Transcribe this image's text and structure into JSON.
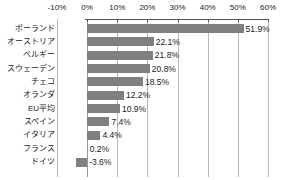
{
  "chart_data": {
    "type": "bar",
    "orientation": "horizontal",
    "title": "",
    "xlabel": "",
    "ylabel": "",
    "xlim": [
      -10,
      60
    ],
    "ylim": null,
    "grid": true,
    "legend": null,
    "axis_tick_labels": [
      "-10%",
      "0%",
      "10%",
      "20%",
      "30%",
      "40%",
      "50%",
      "60%"
    ],
    "axis_tick_values": [
      -10,
      0,
      10,
      20,
      30,
      40,
      50,
      60
    ],
    "bar_color": "#808080",
    "gridline_color": "#b9b9b9",
    "categories": [
      "ポーランド",
      "オーストリア",
      "ベルギー",
      "スウェーデン",
      "チェコ",
      "オランダ",
      "EU平均",
      "スペイン",
      "イタリア",
      "フランス",
      "ドイツ"
    ],
    "values": [
      51.9,
      22.1,
      21.8,
      20.8,
      18.5,
      12.2,
      10.9,
      7.4,
      4.4,
      0.2,
      -3.6
    ],
    "value_labels": [
      "51.9%",
      "22.1%",
      "21.8%",
      "20.8%",
      "18.5%",
      "12.2%",
      "10.9%",
      "7.4%",
      "4.4%",
      "0.2%",
      "-3.6%"
    ]
  }
}
